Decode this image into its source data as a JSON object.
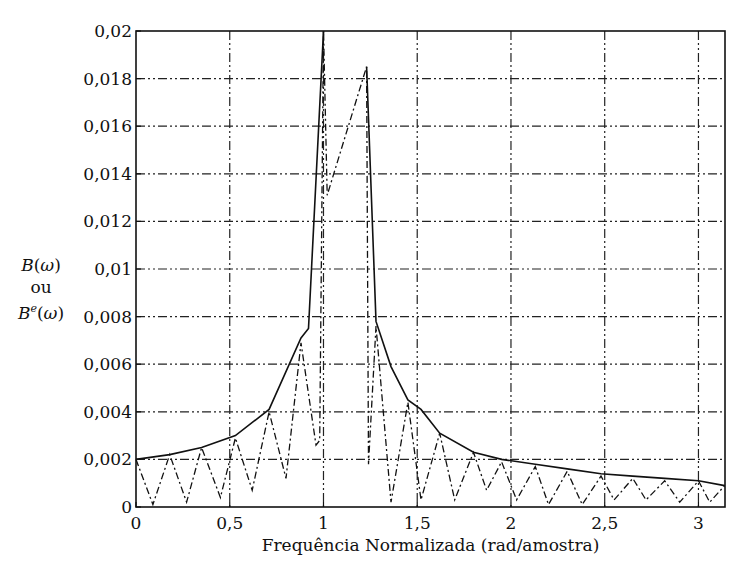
{
  "chart_data": {
    "type": "line",
    "title": "",
    "xlabel": "Frequência Normalizada (rad/amostra)",
    "ylabel": "B(ω) ou Bᵉ(ω)",
    "ylabel_lines": [
      "B(ω)",
      "ou",
      "Be(ω)"
    ],
    "xlim": [
      0,
      3.1416
    ],
    "ylim": [
      0,
      0.02
    ],
    "grid": true,
    "grid_style": "dash-dot",
    "legend": null,
    "x_ticks": [
      0,
      0.5,
      1,
      1.5,
      2,
      2.5,
      3
    ],
    "x_tick_labels": [
      "0",
      "0,5",
      "1",
      "1,5",
      "2",
      "2,5",
      "3"
    ],
    "y_ticks": [
      0,
      0.002,
      0.004,
      0.006,
      0.008,
      0.01,
      0.012,
      0.014,
      0.016,
      0.018,
      0.02
    ],
    "y_tick_labels": [
      "0",
      "0,002",
      "0,004",
      "0,006",
      "0,008",
      "0,01",
      "0,012",
      "0,014",
      "0,016",
      "0,018",
      "0,02"
    ],
    "series": [
      {
        "name": "B(ω)",
        "style": "solid",
        "segments": [
          {
            "x": [
              0,
              0.18,
              0.35,
              0.53,
              0.71,
              0.88,
              0.92,
              1.0
            ],
            "y": [
              0.002,
              0.0022,
              0.0025,
              0.003,
              0.0041,
              0.0071,
              0.0075,
              0.02
            ]
          },
          {
            "x": [
              1.23,
              1.28,
              1.36,
              1.45,
              1.52,
              1.62,
              1.8,
              1.95,
              2.13,
              2.3,
              2.48,
              2.65,
              2.82,
              3.0,
              3.14
            ],
            "y": [
              0.0185,
              0.0078,
              0.0059,
              0.0045,
              0.0041,
              0.0031,
              0.0023,
              0.002,
              0.0018,
              0.0016,
              0.0014,
              0.0013,
              0.0012,
              0.0011,
              0.0009
            ]
          }
        ]
      },
      {
        "name": "Bᵉ(ω)",
        "style": "dash-dot",
        "x": [
          0,
          0.09,
          0.18,
          0.27,
          0.35,
          0.45,
          0.53,
          0.62,
          0.71,
          0.8,
          0.88,
          0.96,
          0.98,
          1.0,
          1.02,
          1.23,
          1.24,
          1.28,
          1.36,
          1.45,
          1.52,
          1.62,
          1.7,
          1.8,
          1.87,
          1.95,
          2.03,
          2.13,
          2.2,
          2.3,
          2.38,
          2.48,
          2.55,
          2.65,
          2.72,
          2.82,
          2.9,
          3.0,
          3.06,
          3.14
        ],
        "y": [
          0.002,
          0.0001,
          0.0022,
          0.0002,
          0.0025,
          0.0004,
          0.0029,
          0.0007,
          0.004,
          0.0012,
          0.0069,
          0.0026,
          0.0028,
          0.02,
          0.0131,
          0.0185,
          0.0018,
          0.0076,
          0.0002,
          0.0044,
          0.0003,
          0.0031,
          0.0003,
          0.0023,
          0.0007,
          0.0019,
          0.0003,
          0.0017,
          0.0001,
          0.0015,
          0.0001,
          0.0013,
          0.0003,
          0.0012,
          0.0003,
          0.0011,
          0.0002,
          0.0011,
          0.0002,
          0.0009
        ]
      }
    ]
  }
}
